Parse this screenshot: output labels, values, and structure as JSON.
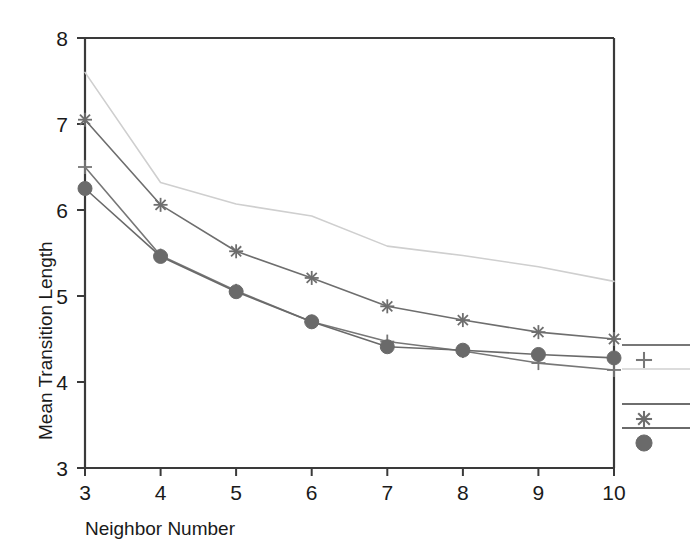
{
  "chart_data": {
    "type": "line",
    "title": "",
    "xlabel": "Neighbor Number",
    "ylabel": "Mean Transition Length",
    "x": [
      3,
      4,
      5,
      6,
      7,
      8,
      9,
      10
    ],
    "xlim": [
      3,
      10
    ],
    "ylim": [
      3,
      8
    ],
    "xticks": [
      "3",
      "4",
      "5",
      "6",
      "7",
      "8",
      "9",
      "10"
    ],
    "yticks": [
      "3",
      "4",
      "5",
      "6",
      "7",
      "8"
    ],
    "grid": false,
    "legend_position": "right-outside",
    "series": [
      {
        "name": "series-faint-top",
        "marker": "none",
        "color": "#cfcfcf",
        "values": [
          7.6,
          6.32,
          6.07,
          5.93,
          5.58,
          5.47,
          5.34,
          5.17
        ]
      },
      {
        "name": "series-asterisk",
        "marker": "asterisk",
        "color": "#6e6e6e",
        "values": [
          7.05,
          6.06,
          5.52,
          5.21,
          4.88,
          4.72,
          4.58,
          4.5
        ]
      },
      {
        "name": "series-plus",
        "marker": "plus",
        "color": "#777777",
        "values": [
          6.5,
          5.47,
          5.06,
          4.7,
          4.47,
          4.36,
          4.22,
          4.14
        ]
      },
      {
        "name": "series-circle",
        "marker": "circle",
        "color": "#6a6a6a",
        "values": [
          6.25,
          5.46,
          5.05,
          4.7,
          4.41,
          4.37,
          4.32,
          4.28
        ]
      }
    ],
    "legend_entries": [
      {
        "label": "",
        "marker": "plus",
        "color": "#777777"
      },
      {
        "label": "",
        "marker": "none",
        "color": "#dcdcdc"
      },
      {
        "label": "",
        "marker": "asterisk",
        "color": "#6e6e6e"
      },
      {
        "label": "",
        "marker": "circle",
        "color": "#6a6a6a"
      }
    ]
  },
  "axes": {
    "x_title": "Neighbor Number",
    "y_title": "Mean Transition Length",
    "x_tick_labels": [
      "3",
      "4",
      "5",
      "6",
      "7",
      "8",
      "9",
      "10"
    ],
    "y_tick_labels": [
      "3",
      "4",
      "5",
      "6",
      "7",
      "8"
    ]
  },
  "colors": {
    "axis": "#3a3a3a",
    "background": "#ffffff",
    "text": "#1a1a1a"
  }
}
